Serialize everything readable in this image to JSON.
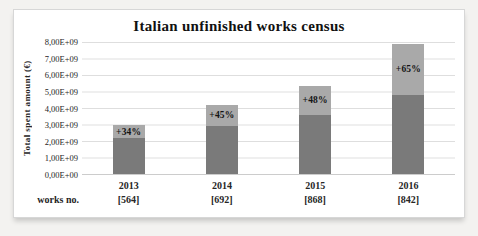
{
  "chart_data": {
    "type": "bar",
    "stacked": true,
    "title": "Italian unfinished works census",
    "ylabel": "Total spent amount (€)",
    "ytick_labels": [
      "8,00E+09",
      "7,00E+09",
      "6,00E+09",
      "5,00E+09",
      "4,00E+09",
      "3,00E+09",
      "2,00E+09",
      "1,00E+09",
      "0,00E+00"
    ],
    "ymax": 8000000000,
    "ylim": [
      0,
      8000000000
    ],
    "grid": true,
    "categories": [
      "2013",
      "2014",
      "2015",
      "2016"
    ],
    "series": [
      {
        "name": "base amount",
        "color": "#7a7a7a",
        "values": [
          2200000000,
          2900000000,
          3600000000,
          4800000000
        ]
      },
      {
        "name": "increase",
        "color": "#a9a9a9",
        "values": [
          750000000,
          1300000000,
          1750000000,
          3100000000
        ]
      }
    ],
    "totals": [
      2950000000,
      4200000000,
      5350000000,
      7900000000
    ],
    "bar_labels": [
      "+34%",
      "+45%",
      "+48%",
      "+65%"
    ],
    "works_row_label": "works no.",
    "works_numbers": [
      "[564]",
      "[692]",
      "[868]",
      "[842]"
    ]
  },
  "colors": {
    "page_background": "#f3f2f0",
    "card_background": "#ffffff",
    "card_border": "#d7d7d7",
    "gridline": "#dedede",
    "text": "#262626"
  }
}
